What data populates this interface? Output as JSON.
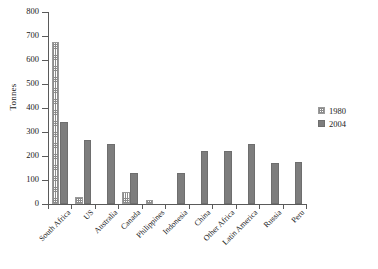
{
  "chart_data": {
    "type": "bar",
    "title": "",
    "subtitle": "",
    "xlabel": "",
    "ylabel": "Tonnes",
    "ylim": [
      0,
      800
    ],
    "yticks": [
      0,
      100,
      200,
      300,
      400,
      500,
      600,
      700,
      800
    ],
    "grid": false,
    "legend_position": "right",
    "categories": [
      "South Africa",
      "US",
      "Australia",
      "Canada",
      "Philippines",
      "Indonesia",
      "China",
      "Other Africa",
      "Latin America",
      "Russia",
      "Peru"
    ],
    "series": [
      {
        "name": "1980",
        "color": "#8c8c8c",
        "pattern": "crosshatch",
        "values": [
          675,
          30,
          0,
          50,
          18,
          0,
          0,
          0,
          0,
          0,
          0
        ]
      },
      {
        "name": "2004",
        "color": "#7d7d7d",
        "pattern": "solid",
        "values": [
          343,
          267,
          250,
          130,
          0,
          130,
          220,
          220,
          248,
          170,
          173
        ]
      }
    ]
  },
  "legend": {
    "entries": [
      {
        "label": "1980"
      },
      {
        "label": "2004"
      }
    ]
  }
}
